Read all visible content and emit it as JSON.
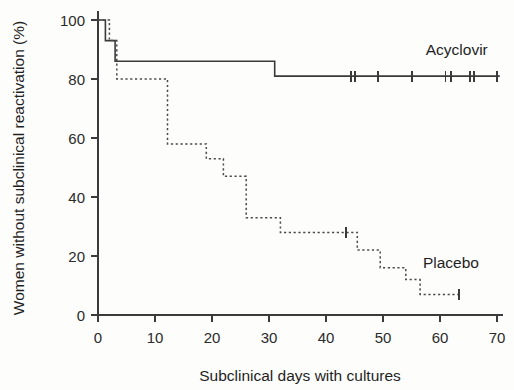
{
  "chart_data": {
    "type": "line",
    "subtype": "kaplan-meier-step",
    "title": "",
    "xlabel": "Subclinical days with cultures",
    "ylabel": "Women without subclinical reactivation (%)",
    "xlim": [
      0,
      71
    ],
    "ylim": [
      0,
      103
    ],
    "xticks": [
      0,
      10,
      20,
      30,
      40,
      50,
      60,
      70
    ],
    "xticklabels": [
      "0",
      "10",
      "20",
      "30",
      "40",
      "50",
      "60",
      "70"
    ],
    "yticks": [
      0,
      20,
      40,
      60,
      80,
      100
    ],
    "yticklabels": [
      "0",
      "20",
      "40",
      "60",
      "80",
      "100"
    ],
    "grid": false,
    "legend_position": "inline-right",
    "series": [
      {
        "name": "Acyclovir",
        "style": "solid",
        "label": "Acyclovir",
        "label_x": 57.5,
        "label_y": 88,
        "points": [
          {
            "x": 0,
            "y": 100
          },
          {
            "x": 1.3,
            "y": 100
          },
          {
            "x": 1.3,
            "y": 93
          },
          {
            "x": 3.0,
            "y": 93
          },
          {
            "x": 3.0,
            "y": 86
          },
          {
            "x": 31.0,
            "y": 86
          },
          {
            "x": 31.0,
            "y": 81
          },
          {
            "x": 70.5,
            "y": 81
          }
        ],
        "censored": [
          {
            "x": 44.4,
            "y": 81
          },
          {
            "x": 45.1,
            "y": 81
          },
          {
            "x": 49.1,
            "y": 81
          },
          {
            "x": 55.1,
            "y": 81
          },
          {
            "x": 61.0,
            "y": 81
          },
          {
            "x": 61.9,
            "y": 81
          },
          {
            "x": 65.3,
            "y": 81
          },
          {
            "x": 66.0,
            "y": 81
          },
          {
            "x": 70.0,
            "y": 81
          }
        ]
      },
      {
        "name": "Placebo",
        "style": "dashed",
        "label": "Placebo",
        "label_x": 57.0,
        "label_y": 16,
        "points": [
          {
            "x": 0,
            "y": 100
          },
          {
            "x": 2.0,
            "y": 100
          },
          {
            "x": 2.0,
            "y": 93
          },
          {
            "x": 3.3,
            "y": 93
          },
          {
            "x": 3.3,
            "y": 80
          },
          {
            "x": 12.2,
            "y": 80
          },
          {
            "x": 12.2,
            "y": 58
          },
          {
            "x": 19.0,
            "y": 58
          },
          {
            "x": 19.0,
            "y": 53
          },
          {
            "x": 22.0,
            "y": 53
          },
          {
            "x": 22.0,
            "y": 47
          },
          {
            "x": 26.0,
            "y": 47
          },
          {
            "x": 26.0,
            "y": 33
          },
          {
            "x": 32.0,
            "y": 33
          },
          {
            "x": 32.0,
            "y": 28
          },
          {
            "x": 45.5,
            "y": 28
          },
          {
            "x": 45.5,
            "y": 22
          },
          {
            "x": 49.5,
            "y": 22
          },
          {
            "x": 49.5,
            "y": 16
          },
          {
            "x": 54.0,
            "y": 16
          },
          {
            "x": 54.0,
            "y": 12
          },
          {
            "x": 56.5,
            "y": 12
          },
          {
            "x": 56.5,
            "y": 7
          },
          {
            "x": 63.5,
            "y": 7
          }
        ],
        "censored": [
          {
            "x": 43.5,
            "y": 28
          },
          {
            "x": 63.3,
            "y": 7
          }
        ]
      }
    ]
  },
  "axes": {
    "y_axis_title": "Women without subclinical reactivation (%)",
    "x_axis_title": "Subclinical days with cultures"
  }
}
